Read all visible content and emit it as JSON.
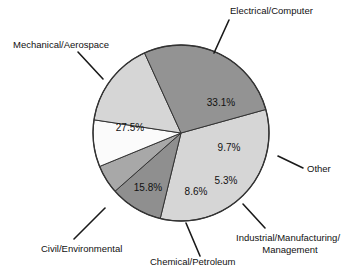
{
  "chart_data": {
    "type": "pie",
    "title": "",
    "subtitle": "",
    "xlabel": "",
    "ylabel": "",
    "legend_position": "none",
    "grid": false,
    "units": "percent",
    "categories": [
      "Electrical/Computer",
      "Other",
      "Industrial/Manufacturing/ Management",
      "Chemical/Petroleum",
      "Civil/Environmental",
      "Mechanical/Aerospace"
    ],
    "values": [
      33.1,
      9.7,
      5.3,
      8.6,
      15.8,
      27.5
    ],
    "value_labels": [
      "33.1%",
      "9.7%",
      "5.3%",
      "8.6%",
      "15.8%",
      "27.5%"
    ],
    "colors": [
      "#d6d6d6",
      "#8f8f8f",
      "#a8a8a8",
      "#fbfbfb",
      "#d6d6d6",
      "#939393"
    ],
    "slices": [
      {
        "name": "Electrical/Computer",
        "value": 33.1,
        "value_label": "33.1%",
        "color": "#d6d6d6",
        "label": "Electrical/Computer",
        "label_lines": [
          "Electrical/Computer"
        ]
      },
      {
        "name": "Other",
        "value": 9.7,
        "value_label": "9.7%",
        "color": "#8f8f8f",
        "label": "Other",
        "label_lines": [
          "Other"
        ]
      },
      {
        "name": "Industrial/Manufacturing/ Management",
        "value": 5.3,
        "value_label": "5.3%",
        "color": "#a8a8a8",
        "label": "Industrial/Manufacturing/ Management",
        "label_lines": [
          "Industrial/Manufacturing/",
          "Management"
        ]
      },
      {
        "name": "Chemical/Petroleum",
        "value": 8.6,
        "value_label": "8.6%",
        "color": "#fbfbfb",
        "label": "Chemical/Petroleum",
        "label_lines": [
          "Chemical/Petroleum"
        ]
      },
      {
        "name": "Civil/Environmental",
        "value": 15.8,
        "value_label": "15.8%",
        "color": "#d6d6d6",
        "label": "Civil/Environmental",
        "label_lines": [
          "Civil/Environmental"
        ]
      },
      {
        "name": "Mechanical/Aerospace",
        "value": 27.5,
        "value_label": "27.5%",
        "color": "#939393",
        "label": "Mechanical/Aerospace",
        "label_lines": [
          "Mechanical/Aerospace"
        ]
      }
    ]
  },
  "labels": {
    "electrical_computer": "Electrical/Computer",
    "mechanical_aerospace": "Mechanical/Aerospace",
    "civil_environmental": "Civil/Environmental",
    "chemical_petroleum": "Chemical/Petroleum",
    "industrial_line1": "Industrial/Manufacturing/",
    "industrial_line2": "Management",
    "other": "Other"
  },
  "values": {
    "electrical_computer": "33.1%",
    "mechanical_aerospace": "27.5%",
    "civil_environmental": "15.8%",
    "chemical_petroleum": "8.6%",
    "industrial": "5.3%",
    "other": "9.7%"
  },
  "geometry": {
    "center_x": 181,
    "center_y": 133,
    "radius": 88,
    "start_angle_deg": -15.5
  },
  "colors": {
    "background": "#ffffff",
    "outline": "#333333",
    "text": "#111111",
    "leader": "#1a1a1a"
  }
}
